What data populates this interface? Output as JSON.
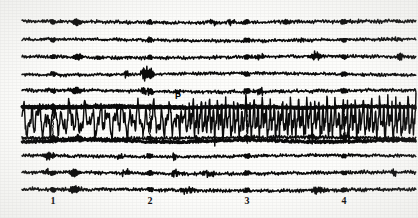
{
  "figure": {
    "kind": "seismogram",
    "background_color": "#fdfdfb",
    "trace_color": "#0b0b0b",
    "width": 418,
    "height": 218
  },
  "axis": {
    "name": "time-axis",
    "tick_labels": [
      "1",
      "2",
      "3",
      "4"
    ],
    "tick_x_positions": [
      53,
      150,
      247,
      344
    ],
    "label_y": 198,
    "unit_spacing_px": 97
  },
  "annotations": [
    {
      "name": "p-wave-arrival",
      "label": "P",
      "x": 178,
      "y": 92
    }
  ],
  "chart_data": {
    "type": "line",
    "title": "",
    "xlabel": "",
    "ylabel": "",
    "xlim": [
      0,
      4.8
    ],
    "ylim": [
      0,
      10
    ],
    "grid": false,
    "legend": false,
    "x_tick_values": [
      1,
      2,
      3,
      4
    ],
    "x_tick_labels": [
      "1",
      "2",
      "3",
      "4"
    ],
    "trace_start_x": 22,
    "trace_end_x": 416,
    "minute_mark_x": [
      53,
      150,
      247,
      344
    ],
    "series": [
      {
        "name": "trace-1",
        "baseline_y": 22,
        "amplitude": 1.6,
        "active": false,
        "seed": 11
      },
      {
        "name": "trace-2",
        "baseline_y": 40,
        "amplitude": 1.4,
        "active": false,
        "seed": 23
      },
      {
        "name": "trace-3",
        "baseline_y": 57,
        "amplitude": 1.5,
        "active": false,
        "seed": 37
      },
      {
        "name": "trace-4",
        "baseline_y": 74,
        "amplitude": 1.4,
        "active": false,
        "seed": 51
      },
      {
        "name": "trace-5",
        "baseline_y": 91,
        "amplitude": 1.6,
        "active": false,
        "seed": 67
      },
      {
        "name": "trace-6",
        "baseline_y": 107,
        "amplitude": 1.5,
        "active": false,
        "seed": 79
      },
      {
        "name": "trace-event",
        "baseline_y": 120,
        "amplitude": 20,
        "active": true,
        "seed": 97,
        "p_arrival_x": 180,
        "pre_amplitude": 17,
        "post_amplitude": 21
      },
      {
        "name": "trace-7",
        "baseline_y": 138,
        "amplitude": 1.6,
        "active": false,
        "seed": 113
      },
      {
        "name": "trace-8",
        "baseline_y": 156,
        "amplitude": 1.4,
        "active": false,
        "seed": 131
      },
      {
        "name": "trace-9",
        "baseline_y": 173,
        "amplitude": 1.5,
        "active": false,
        "seed": 149
      },
      {
        "name": "trace-10",
        "baseline_y": 190,
        "amplitude": 1.6,
        "active": false,
        "seed": 167
      }
    ]
  }
}
